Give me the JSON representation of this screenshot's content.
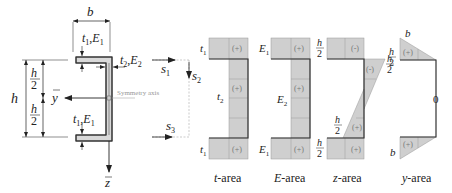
{
  "figure": {
    "cross_section": {
      "labels": {
        "width": "b",
        "flange_top": {
          "t": "t",
          "t_sub": "1",
          "E": "E",
          "E_sub": "1"
        },
        "web": {
          "t": "t",
          "t_sub": "2",
          "E": "E",
          "E_sub": "2"
        },
        "flange_bottom": {
          "t": "t",
          "t_sub": "1",
          "E": "E",
          "E_sub": "1"
        },
        "height": "h",
        "half_height_num": "h",
        "half_height_den": "2",
        "y_axis": "y",
        "z_axis": "z",
        "symmetry_axis": "Symmetry axis"
      },
      "path_coords": {
        "s1": {
          "s": "s",
          "sub": "1"
        },
        "s2": {
          "s": "s",
          "sub": "2"
        },
        "s3": {
          "s": "s",
          "sub": "3"
        }
      }
    },
    "area_diagrams": [
      {
        "name": "t-area",
        "caption_var": "t",
        "caption_rest": "-area",
        "top_label": {
          "v": "t",
          "sub": "1"
        },
        "web_label": {
          "v": "t",
          "sub": "2"
        },
        "bottom_label": {
          "v": "t",
          "sub": "1"
        },
        "signs": {
          "top": "(+)",
          "web": "(+)",
          "bottom": "(+)"
        }
      },
      {
        "name": "E-area",
        "caption_var": "E",
        "caption_rest": "-area",
        "top_label": {
          "v": "E",
          "sub": "1"
        },
        "web_label": {
          "v": "E",
          "sub": "2"
        },
        "bottom_label": {
          "v": "E",
          "sub": "1"
        },
        "signs": {
          "top": "(+)",
          "web": "(+)",
          "bottom": "(+)"
        }
      },
      {
        "name": "z-area",
        "caption_var": "z",
        "caption_rest": "-area",
        "frac_num": "h",
        "frac_den": "2",
        "signs": {
          "top": "(-)",
          "web_top": "(-)",
          "web_bottom": "(+)",
          "bottom": "(+)"
        }
      },
      {
        "name": "y-area",
        "caption_var": "y",
        "caption_rest": "-area",
        "top_label": "b",
        "bottom_label": "b",
        "frac_num": "h",
        "frac_den": "2",
        "web_value": "0",
        "signs": {
          "top": "(+)",
          "bottom": "(+)"
        }
      }
    ],
    "colors": {
      "fill": "#cfcfcf",
      "grid": "#999999",
      "outline": "#333333",
      "dashed": "#aaaaaa"
    }
  }
}
